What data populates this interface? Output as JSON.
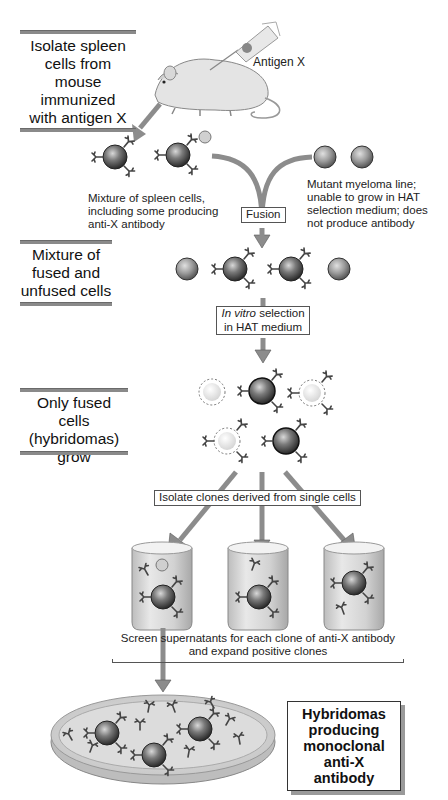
{
  "diagram": {
    "steps": [
      {
        "id": "isolate",
        "lines": [
          "Isolate spleen",
          "cells from mouse",
          "immunized",
          "with antigen X"
        ]
      },
      {
        "id": "mixture",
        "lines": [
          "Mixture of",
          "fused and",
          "unfused cells"
        ]
      },
      {
        "id": "only_fused",
        "lines": [
          "Only fused cells",
          "(hybridomas)",
          "grow"
        ]
      }
    ],
    "labels": {
      "antigen": "Antigen X",
      "spleen_cells": [
        "Mixture of spleen cells,",
        "including some producing",
        "anti-X antibody"
      ],
      "myeloma": [
        "Mutant myeloma line;",
        "unable to grow in HAT",
        "selection medium; does",
        "not produce antibody"
      ],
      "fusion": "Fusion",
      "in_vitro_italic": "In vitro",
      "in_vitro_rest": " selection",
      "in_vitro_line2": "in HAT medium",
      "isolate_clones": "Isolate clones derived from single cells",
      "screen": [
        "Screen supernatants for each clone of anti-X antibody",
        "and expand positive clones"
      ]
    },
    "result": {
      "lines": [
        "Hybridomas",
        "producing",
        "monoclonal",
        "anti-X antibody"
      ]
    },
    "colors": {
      "arrow": "#8c8c8c",
      "cell_dark": "#3a3a3a",
      "cell_light": "#e6e6e6",
      "beaker": "#d4d4d4",
      "rule": "#8a8a8a"
    }
  }
}
